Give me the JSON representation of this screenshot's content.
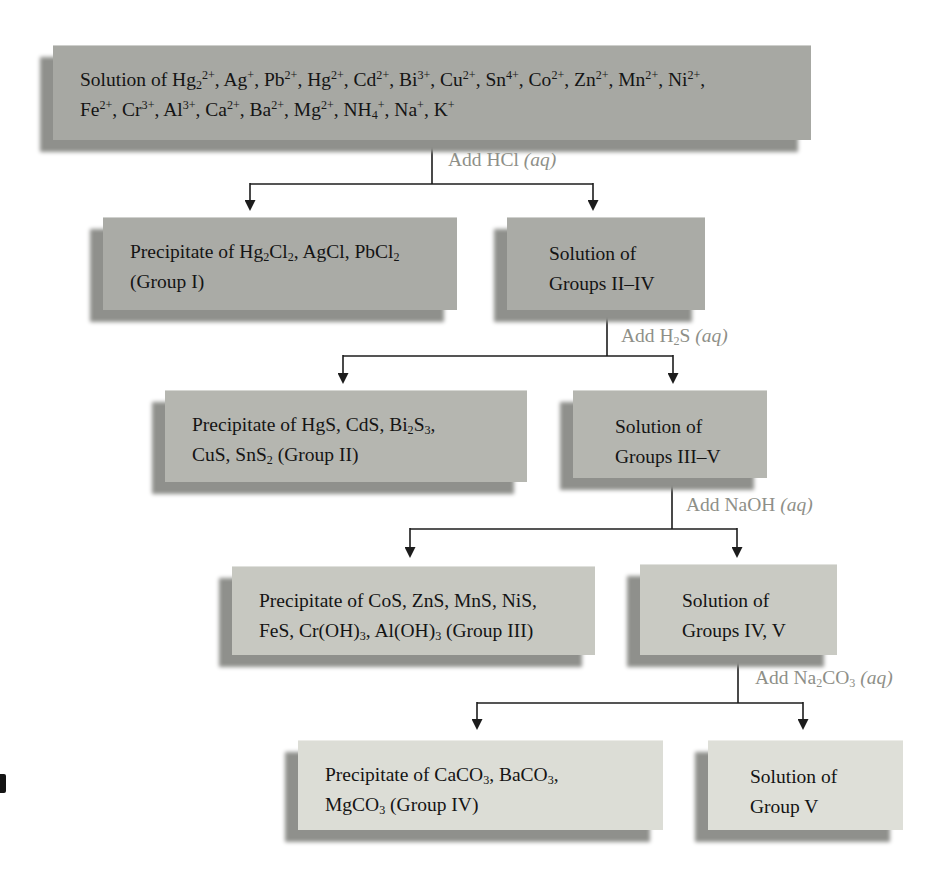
{
  "figure": {
    "type": "flowchart",
    "background": "#ffffff",
    "line_color": "#1c1c1c",
    "reagent_label_color": "#8e8f88",
    "shadow_color": "#8f908c",
    "text_color": "#141414"
  },
  "boxes": {
    "initial_solution": {
      "fill": "#a7a8a3",
      "text": "Solution of Hg~2~^2+^, Ag^+^, Pb^2+^, Hg^2+^, Cd^2+^, Bi^3+^, Cu^2+^, Sn^4+^, Co^2+^, Zn^2+^, Mn^2+^, Ni^2+^,\nFe^2+^, Cr^3+^, Al^3+^, Ca^2+^, Ba^2+^, Mg^2+^, NH~4~^+^, Na^+^, K^+^"
    },
    "group1_precipitate": {
      "fill": "#aaaba6",
      "text": "Precipitate of Hg~2~Cl~2~, AgCl, PbCl~2~\n(Group I)"
    },
    "solution_groups_2_4": {
      "fill": "#aaaba6",
      "text": "Solution of\nGroups II–IV"
    },
    "group2_precipitate": {
      "fill": "#b5b6b0",
      "text": "Precipitate of HgS, CdS, Bi~2~S~3~,\nCuS, SnS~2~ (Group II)"
    },
    "solution_groups_3_5": {
      "fill": "#b5b6b0",
      "text": "Solution of\nGroups III–V"
    },
    "group3_precipitate": {
      "fill": "#c7c8c1",
      "text": "Precipitate of CoS, ZnS, MnS, NiS,\nFeS, Cr(OH)~3~, Al(OH)~3~ (Group III)"
    },
    "solution_groups_4_5": {
      "fill": "#c9cac3",
      "text": "Solution of\nGroups IV, V"
    },
    "group4_precipitate": {
      "fill": "#dcddd6",
      "text": "Precipitate of CaCO~3~, BaCO~3~,\nMgCO~3~ (Group IV)"
    },
    "solution_group_5": {
      "fill": "#dedfd8",
      "text": "Solution of\nGroup V"
    }
  },
  "reagent_steps": [
    {
      "label": "Add HCl *(aq)*"
    },
    {
      "label": "Add H~2~S *(aq)*"
    },
    {
      "label": "Add NaOH *(aq)*"
    },
    {
      "label": "Add Na~2~CO~3~ *(aq)*"
    }
  ]
}
